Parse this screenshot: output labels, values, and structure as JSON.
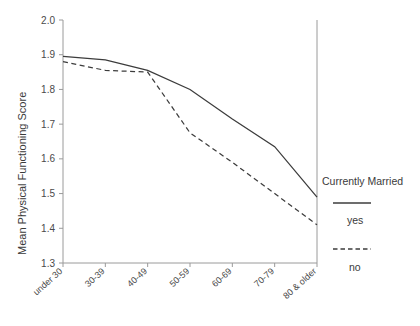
{
  "chart_data": {
    "type": "line",
    "title": "",
    "xlabel": "",
    "ylabel": "Mean Physical Functioning Score",
    "categories": [
      "under 30",
      "30-39",
      "40-49",
      "50-59",
      "60-69",
      "70-79",
      "80 & older"
    ],
    "series": [
      {
        "name": "yes",
        "style": "solid",
        "values": [
          1.895,
          1.885,
          1.855,
          1.8,
          1.715,
          1.635,
          1.49
        ]
      },
      {
        "name": "no",
        "style": "dashed",
        "values": [
          1.88,
          1.855,
          1.85,
          1.675,
          1.59,
          1.5,
          1.41
        ]
      }
    ],
    "ylim": [
      1.3,
      2.0
    ],
    "ytick_labels": [
      "2.0",
      "1.9",
      "1.8",
      "1.7",
      "1.6",
      "1.5",
      "1.4",
      "1.3"
    ],
    "ytick_values": [
      2.0,
      1.9,
      1.8,
      1.7,
      1.6,
      1.5,
      1.4,
      1.3
    ],
    "grid": false,
    "legend_position": "right",
    "legend": {
      "title": "Currently Married",
      "entries": [
        {
          "label": "yes",
          "style": "solid"
        },
        {
          "label": "no",
          "style": "dashed"
        }
      ]
    },
    "line_color": "#3c3c3c",
    "axis_color": "#9a9a9a"
  }
}
